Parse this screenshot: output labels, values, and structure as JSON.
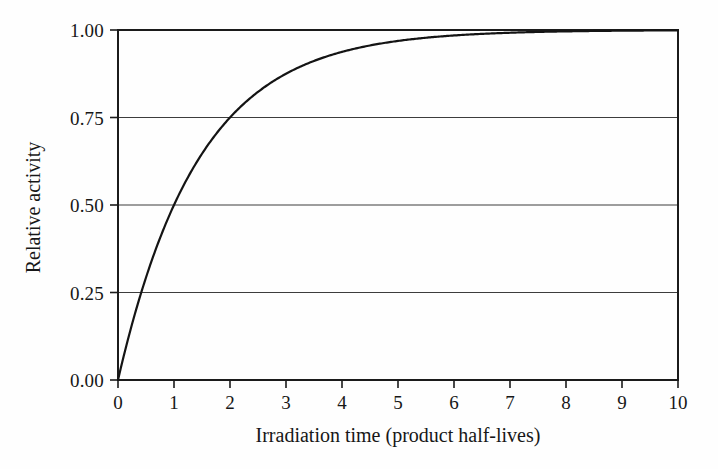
{
  "chart_data": {
    "type": "line",
    "title": "",
    "subtitle": "",
    "xlabel": "Irradiation time (product half-lives)",
    "ylabel": "Relative activity",
    "xlim": [
      0,
      10
    ],
    "ylim": [
      0,
      1.0
    ],
    "grid": "horizontal",
    "legend": "none",
    "xticks": [
      0,
      1,
      2,
      3,
      4,
      5,
      6,
      7,
      8,
      9,
      10
    ],
    "xtick_labels": [
      "0",
      "1",
      "2",
      "3",
      "4",
      "5",
      "6",
      "7",
      "8",
      "9",
      "10"
    ],
    "yticks": [
      0.0,
      0.25,
      0.5,
      0.75,
      1.0
    ],
    "ytick_labels": [
      "0.00",
      "0.25",
      "0.50",
      "0.75",
      "1.00"
    ],
    "gridlines_y": [
      0.25,
      0.5,
      0.75,
      1.0
    ],
    "series": [
      {
        "name": "Saturation activity",
        "formula": "y = 1 - 2^(-x)",
        "color": "#141414",
        "line_width": 2.2,
        "x": [
          0,
          0.1,
          0.2,
          0.3,
          0.4,
          0.5,
          0.6,
          0.7,
          0.8,
          0.9,
          1,
          1.2,
          1.4,
          1.6,
          1.8,
          2,
          2.25,
          2.5,
          2.75,
          3,
          3.25,
          3.5,
          3.75,
          4,
          4.5,
          5,
          5.5,
          6,
          6.5,
          7,
          7.5,
          8,
          8.5,
          9,
          9.5,
          10
        ],
        "y": [
          0,
          0.067,
          0.129,
          0.188,
          0.242,
          0.293,
          0.341,
          0.385,
          0.426,
          0.464,
          0.5,
          0.565,
          0.621,
          0.67,
          0.713,
          0.75,
          0.79,
          0.823,
          0.851,
          0.875,
          0.895,
          0.912,
          0.926,
          0.938,
          0.956,
          0.969,
          0.978,
          0.984,
          0.989,
          0.992,
          0.994,
          0.996,
          0.997,
          0.998,
          0.999,
          0.999
        ]
      }
    ]
  },
  "axis": {
    "frame_color": "#1b1b1b",
    "grid_color": "#3a3a3a",
    "background": "#fefefe"
  },
  "labels": {
    "x_axis_title": "Irradiation time (product half-lives)",
    "y_axis_title": "Relative activity"
  },
  "ytick_positions": {
    "t0": "0.00",
    "t1": "0.25",
    "t2": "0.50",
    "t3": "0.75",
    "t4": "1.00"
  },
  "xtick_positions": {
    "t0": "0",
    "t1": "1",
    "t2": "2",
    "t3": "3",
    "t4": "4",
    "t5": "5",
    "t6": "6",
    "t7": "7",
    "t8": "8",
    "t9": "9",
    "t10": "10"
  }
}
